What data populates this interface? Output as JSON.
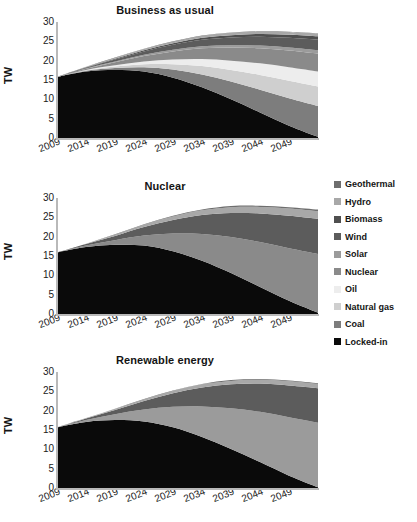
{
  "figure": {
    "ylabel": "TW",
    "yticks": [
      0,
      5,
      10,
      15,
      20,
      25,
      30
    ],
    "xticks": [
      "2009",
      "2014",
      "2019",
      "2024",
      "2029",
      "2034",
      "2039",
      "2044",
      "2049"
    ]
  },
  "legend": {
    "position": "right",
    "items": [
      {
        "label": "Geothermal",
        "color": "#6e6e6e"
      },
      {
        "label": "Hydro",
        "color": "#a8a8a8"
      },
      {
        "label": "Biomass",
        "color": "#4f4f4f"
      },
      {
        "label": "Wind",
        "color": "#5c5c5c"
      },
      {
        "label": "Solar",
        "color": "#9b9b9b"
      },
      {
        "label": "Nuclear",
        "color": "#8a8a8a"
      },
      {
        "label": "Oil",
        "color": "#ededed"
      },
      {
        "label": "Natural gas",
        "color": "#cfcfcf"
      },
      {
        "label": "Coal",
        "color": "#7d7d7d"
      },
      {
        "label": "Locked-in",
        "color": "#0a0a0a"
      }
    ]
  },
  "chart_data": [
    {
      "type": "area",
      "title": "Business as usual",
      "xlabel": "",
      "ylabel": "TW",
      "x": [
        2009,
        2014,
        2019,
        2024,
        2029,
        2034,
        2039,
        2044,
        2049,
        2054
      ],
      "xlim": [
        2009,
        2054
      ],
      "ylim": [
        0,
        30
      ],
      "grid": false,
      "stacked": true,
      "series": [
        {
          "name": "Locked-in",
          "color": "#0a0a0a",
          "values": [
            15.8,
            17.2,
            17.6,
            17.2,
            15.6,
            13.1,
            10.0,
            6.6,
            3.2,
            0.3
          ]
        },
        {
          "name": "Coal",
          "color": "#7d7d7d",
          "values": [
            0.0,
            0.2,
            0.5,
            1.1,
            2.1,
            3.3,
            4.6,
            5.9,
            7.1,
            8.0
          ]
        },
        {
          "name": "Natural gas",
          "color": "#cfcfcf",
          "values": [
            0.0,
            0.1,
            0.4,
            0.8,
            1.4,
            2.2,
            3.0,
            3.8,
            4.5,
            5.0
          ]
        },
        {
          "name": "Oil",
          "color": "#ededed",
          "values": [
            0.0,
            0.1,
            0.3,
            0.7,
            1.2,
            1.8,
            2.4,
            3.0,
            3.5,
            3.9
          ]
        },
        {
          "name": "Nuclear",
          "color": "#8a8a8a",
          "values": [
            0.0,
            0.3,
            0.8,
            1.4,
            2.1,
            2.8,
            3.4,
            3.9,
            4.3,
            4.6
          ]
        },
        {
          "name": "Solar",
          "color": "#9b9b9b",
          "values": [
            0.0,
            0.1,
            0.2,
            0.3,
            0.4,
            0.5,
            0.6,
            0.7,
            0.8,
            0.9
          ]
        },
        {
          "name": "Wind",
          "color": "#5c5c5c",
          "values": [
            0.0,
            0.2,
            0.5,
            0.9,
            1.3,
            1.7,
            2.0,
            2.3,
            2.5,
            2.7
          ]
        },
        {
          "name": "Biomass",
          "color": "#4f4f4f",
          "values": [
            0.0,
            0.1,
            0.2,
            0.3,
            0.4,
            0.5,
            0.6,
            0.7,
            0.8,
            0.9
          ]
        },
        {
          "name": "Hydro",
          "color": "#a8a8a8",
          "values": [
            0.0,
            0.1,
            0.2,
            0.3,
            0.4,
            0.5,
            0.6,
            0.6,
            0.7,
            0.7
          ]
        },
        {
          "name": "Geothermal",
          "color": "#6e6e6e",
          "values": [
            0.0,
            0.0,
            0.1,
            0.1,
            0.1,
            0.1,
            0.1,
            0.1,
            0.1,
            0.1
          ]
        }
      ]
    },
    {
      "type": "area",
      "title": "Nuclear",
      "xlabel": "",
      "ylabel": "TW",
      "x": [
        2009,
        2014,
        2019,
        2024,
        2029,
        2034,
        2039,
        2044,
        2049,
        2054
      ],
      "xlim": [
        2009,
        2054
      ],
      "ylim": [
        0,
        30
      ],
      "grid": false,
      "stacked": true,
      "series": [
        {
          "name": "Locked-in",
          "color": "#0a0a0a",
          "values": [
            15.9,
            17.3,
            17.9,
            17.7,
            16.2,
            13.8,
            10.6,
            7.0,
            3.4,
            0.3
          ]
        },
        {
          "name": "Nuclear",
          "color": "#8a8a8a",
          "values": [
            0.0,
            0.4,
            1.2,
            2.6,
            4.6,
            6.9,
            9.3,
            11.6,
            13.6,
            15.2
          ]
        },
        {
          "name": "Wind",
          "color": "#5c5c5c",
          "values": [
            0.0,
            0.4,
            1.1,
            2.2,
            3.5,
            4.9,
            6.2,
            7.4,
            8.4,
            9.1
          ]
        },
        {
          "name": "Hydro",
          "color": "#a8a8a8",
          "values": [
            0.0,
            0.1,
            0.3,
            0.6,
            0.9,
            1.2,
            1.5,
            1.7,
            1.9,
            2.0
          ]
        },
        {
          "name": "Geothermal",
          "color": "#6e6e6e",
          "values": [
            0.0,
            0.0,
            0.1,
            0.1,
            0.2,
            0.2,
            0.3,
            0.3,
            0.3,
            0.4
          ]
        }
      ]
    },
    {
      "type": "area",
      "title": "Renewable energy",
      "xlabel": "",
      "ylabel": "TW",
      "x": [
        2009,
        2014,
        2019,
        2024,
        2029,
        2034,
        2039,
        2044,
        2049,
        2054
      ],
      "xlim": [
        2009,
        2054
      ],
      "ylim": [
        0,
        30
      ],
      "grid": false,
      "stacked": true,
      "series": [
        {
          "name": "Locked-in",
          "color": "#0a0a0a",
          "values": [
            15.7,
            17.1,
            17.6,
            17.2,
            15.7,
            13.2,
            10.1,
            6.7,
            3.2,
            0.2
          ]
        },
        {
          "name": "Solar",
          "color": "#9b9b9b",
          "values": [
            0.0,
            0.5,
            1.5,
            3.1,
            5.3,
            7.9,
            10.5,
            13.0,
            15.1,
            16.7
          ]
        },
        {
          "name": "Wind",
          "color": "#5c5c5c",
          "values": [
            0.0,
            0.4,
            1.1,
            2.2,
            3.5,
            4.9,
            6.2,
            7.3,
            8.2,
            8.9
          ]
        },
        {
          "name": "Hydro",
          "color": "#a8a8a8",
          "values": [
            0.0,
            0.1,
            0.2,
            0.4,
            0.6,
            0.8,
            0.9,
            1.0,
            1.1,
            1.1
          ]
        },
        {
          "name": "Geothermal",
          "color": "#6e6e6e",
          "values": [
            0.0,
            0.0,
            0.1,
            0.1,
            0.1,
            0.1,
            0.2,
            0.2,
            0.2,
            0.2
          ]
        }
      ]
    }
  ]
}
